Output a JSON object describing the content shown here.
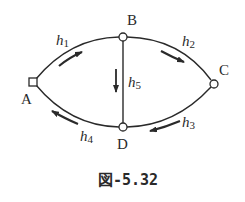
{
  "figure": {
    "caption": "図-5.32",
    "colors": {
      "stroke": "#2a2a2a",
      "background": "#ffffff"
    },
    "nodes": [
      {
        "id": "A",
        "label": "A",
        "shape": "square",
        "x": 33,
        "y": 82
      },
      {
        "id": "B",
        "label": "B",
        "shape": "circle",
        "x": 123,
        "y": 37
      },
      {
        "id": "C",
        "label": "C",
        "shape": "circle",
        "x": 214,
        "y": 84
      },
      {
        "id": "D",
        "label": "D",
        "shape": "circle",
        "x": 123,
        "y": 127
      }
    ],
    "edges": [
      {
        "id": "h1",
        "from": "A",
        "to": "B",
        "label": "h",
        "sub": "1",
        "flow": "A→B"
      },
      {
        "id": "h2",
        "from": "B",
        "to": "C",
        "label": "h",
        "sub": "2",
        "flow": "B→C"
      },
      {
        "id": "h3",
        "from": "C",
        "to": "D",
        "label": "h",
        "sub": "3",
        "flow": "C→D"
      },
      {
        "id": "h4",
        "from": "D",
        "to": "A",
        "label": "h",
        "sub": "4",
        "flow": "D→A"
      },
      {
        "id": "h5",
        "from": "B",
        "to": "D",
        "label": "h",
        "sub": "5",
        "flow": "B→D"
      }
    ]
  }
}
